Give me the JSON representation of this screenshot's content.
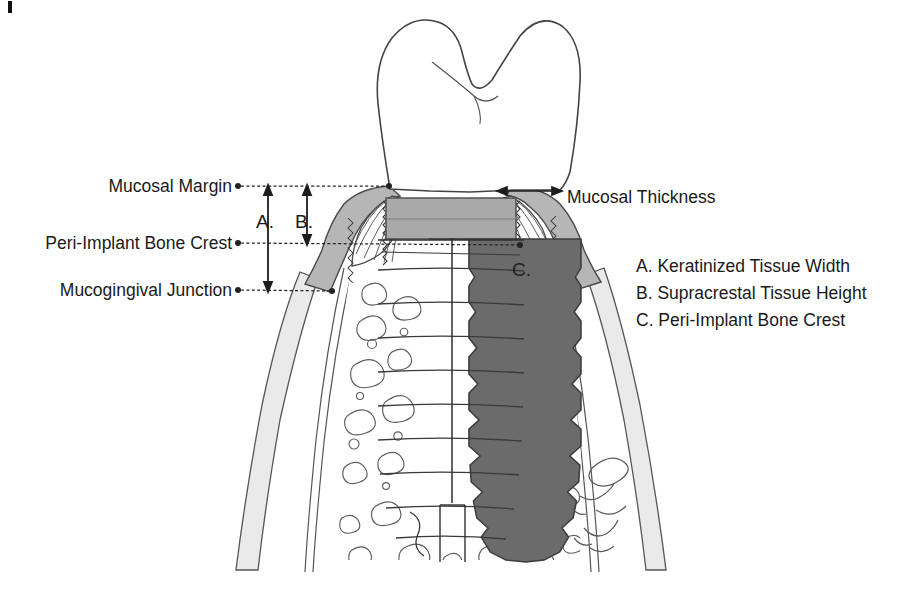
{
  "figure": {
    "background_color": "#ffffff"
  },
  "left_labels": [
    {
      "id": "mucosal-margin",
      "text": "Mucosal Margin",
      "y": 186,
      "text_anchor_x": 232,
      "dot_x": 238,
      "line_end_x": 389
    },
    {
      "id": "peri-implant-bone-crest",
      "text": "Peri-Implant Bone Crest",
      "y": 243,
      "text_anchor_x": 232,
      "dot_x": 238,
      "line_end_x": 520
    },
    {
      "id": "mucogingival-junction",
      "text": "Mucogingival Junction",
      "y": 290,
      "text_anchor_x": 232,
      "dot_x": 238,
      "line_end_x": 330
    }
  ],
  "measure_letters": [
    {
      "id": "letter-a",
      "text": "A.",
      "x": 259,
      "y": 221
    },
    {
      "id": "letter-b",
      "text": "B.",
      "x": 297,
      "y": 221
    }
  ],
  "crest_marker": {
    "id": "letter-c",
    "text": "C.",
    "x": 514,
    "y": 271
  },
  "right_callout": {
    "id": "mucosal-thickness",
    "text": "Mucosal Thickness",
    "text_x": 567,
    "text_y": 202,
    "arrow_y": 191,
    "arrow_x1": 498,
    "arrow_x2": 560
  },
  "legend": {
    "x": 636,
    "start_y": 272,
    "line_height": 27,
    "items": [
      {
        "key": "A.",
        "label": "Keratinized Tissue Width",
        "text": "A. Keratinized Tissue Width"
      },
      {
        "key": "B.",
        "label": "Supracrestal Tissue Height",
        "text": "B. Supracrestal Tissue Height"
      },
      {
        "key": "C.",
        "label": "Peri-Implant Bone Crest",
        "text": "C. Peri-Implant Bone Crest"
      }
    ]
  },
  "colors": {
    "ink": "#3a3a3a",
    "text": "#1a1a1a",
    "crown_fill": "#ffffff",
    "keratinized_mucosa": "#b4b4b4",
    "alveolar_mucosa": "#e8e8e8",
    "abutment_fill": "#a8a8a8",
    "implant_fill": "#6a6a6a",
    "bone_fill": "#ffffff",
    "marrow_outline": "#5a5a5a",
    "leader_line": "#2d2d2d"
  },
  "measurements": {
    "keratinized_tissue_width_span": {
      "from": "Mucosal Margin",
      "to": "Mucogingival Junction"
    },
    "supracrestal_tissue_height_span": {
      "from": "Mucosal Margin",
      "to": "Peri-Implant Bone Crest"
    }
  },
  "artifacts": {
    "page_mark": {
      "x": 8,
      "y": 1,
      "width": 4,
      "height": 12
    },
    "signature_present": true
  }
}
